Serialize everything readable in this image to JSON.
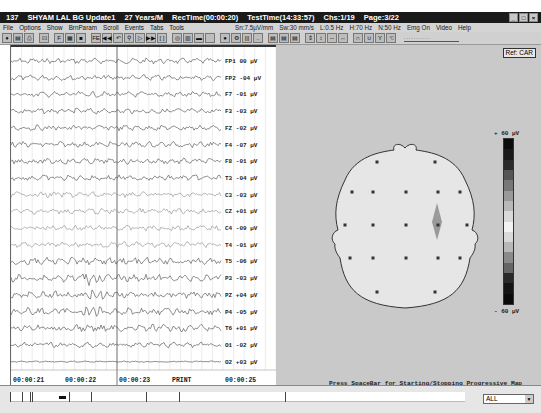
{
  "titlebar": {
    "record_id": "137",
    "patient": "SHYAM LAL BG Update1",
    "age_sex": "27 Years/M",
    "rec_time": "RecTime(00:00:20)",
    "test_time": "TestTime(14:33:57)",
    "channel": "Chs:1/19",
    "page": "Page:3/22",
    "minimize": "_",
    "maximize": "□",
    "close": "×"
  },
  "menu": {
    "items": [
      "File",
      "Options",
      "Show",
      "BrnParam",
      "Scroll",
      "Events",
      "Tabs",
      "Tools"
    ],
    "status": [
      "Sn:7.5µV/mm",
      "Sw:30 mm/s",
      "L:0.5 Hz",
      "H:70 Hz",
      "N:50 Hz",
      "Emg On"
    ],
    "right_items": [
      "Video",
      "Help"
    ]
  },
  "toolbar": {
    "buttons": [
      {
        "name": "montage-icon",
        "glyph": "♦"
      },
      {
        "name": "open-icon",
        "glyph": "▤"
      },
      {
        "name": "print-icon",
        "glyph": "⎙"
      },
      {
        "name": "fit-icon",
        "glyph": "⊡"
      },
      {
        "name": "filter-icon",
        "glyph": "F"
      },
      {
        "name": "page-icon",
        "glyph": "▦"
      },
      {
        "name": "block-icon",
        "glyph": "■"
      },
      {
        "name": "fe-icon",
        "glyph": "FE"
      },
      {
        "name": "rewind-icon",
        "glyph": "◀◀"
      },
      {
        "name": "back-icon",
        "glyph": "↶"
      },
      {
        "name": "search-icon",
        "glyph": "⚲"
      },
      {
        "name": "mark-icon",
        "glyph": "▷"
      },
      {
        "name": "forward-icon",
        "glyph": "▶▶"
      },
      {
        "name": "bracket-icon",
        "glyph": "[ ]"
      },
      {
        "name": "photo-icon",
        "glyph": "◎"
      },
      {
        "name": "grid-icon",
        "glyph": "▥"
      },
      {
        "name": "bar-icon",
        "glyph": "▬"
      },
      {
        "name": "blank-icon",
        "glyph": ""
      },
      {
        "name": "record-icon",
        "glyph": "●"
      },
      {
        "name": "settings-icon",
        "glyph": "⚙"
      },
      {
        "name": "columns-icon",
        "glyph": "|||"
      },
      {
        "name": "dots-icon",
        "glyph": ".."
      },
      {
        "name": "map1-icon",
        "glyph": "▤"
      },
      {
        "name": "map2-icon",
        "glyph": "▤"
      },
      {
        "name": "map3-icon",
        "glyph": "▤"
      },
      {
        "name": "collapse-icon",
        "glyph": "⇕"
      },
      {
        "name": "expand-icon",
        "glyph": "↕"
      },
      {
        "name": "narrow-icon",
        "glyph": "⇔"
      },
      {
        "name": "widen-icon",
        "glyph": "↔"
      },
      {
        "name": "wave-icon",
        "glyph": "∩"
      },
      {
        "name": "wave2-icon",
        "glyph": "∪"
      },
      {
        "name": "marker-icon",
        "glyph": "Y"
      },
      {
        "name": "cursor-icon",
        "glyph": "☜"
      }
    ],
    "slider_label": "..........."
  },
  "eeg": {
    "timestamps": [
      {
        "label": "00:00:21",
        "x": 0
      },
      {
        "label": "00:00:22",
        "x": 52
      },
      {
        "label": "00:00:23",
        "x": 106
      },
      {
        "label": "PRINT",
        "x": 159
      },
      {
        "label": "00:00:25",
        "x": 212
      }
    ],
    "channels": [
      {
        "name": "FP1",
        "value": "00 µV"
      },
      {
        "name": "FP2",
        "value": "-04 µV"
      },
      {
        "name": "F7",
        "value": "-01 µV"
      },
      {
        "name": "F3",
        "value": "-03 µV"
      },
      {
        "name": "FZ",
        "value": "-02 µV"
      },
      {
        "name": "F4",
        "value": "-07 µV"
      },
      {
        "name": "F8",
        "value": "-01 µV"
      },
      {
        "name": "T3",
        "value": "-04 µV"
      },
      {
        "name": "C3",
        "value": "-03 µV"
      },
      {
        "name": "CZ",
        "value": "+01 µV"
      },
      {
        "name": "C4",
        "value": "-09 µV"
      },
      {
        "name": "T4",
        "value": "-01 µV"
      },
      {
        "name": "T5",
        "value": "-06 µV"
      },
      {
        "name": "P3",
        "value": "-03 µV"
      },
      {
        "name": "PZ",
        "value": "+04 µV"
      },
      {
        "name": "P4",
        "value": "-05 µV"
      },
      {
        "name": "T6",
        "value": "+01 µV"
      },
      {
        "name": "O1",
        "value": "-02 µV"
      },
      {
        "name": "O2",
        "value": "+03 µV"
      }
    ]
  },
  "map": {
    "reference": "Ref: CAR",
    "scale_max": "+ 60 µV",
    "scale_min": "- 60 µV",
    "colorbar": [
      "#0c0c0c",
      "#1a1a1a",
      "#2a2a2a",
      "#555555",
      "#777777",
      "#999999",
      "#b8b8b8",
      "#d9d9d9",
      "#f2f2f2",
      "#d9d9d9",
      "#b8b8b8",
      "#8a8a8a",
      "#666666",
      "#2a2a2a",
      "#141414",
      "#0a0a0a"
    ],
    "hint": "Press SpaceBar for Starting/Stopping Progressive Map"
  },
  "statusbar": {
    "select_value": "ALL",
    "select_arrow": "▼"
  }
}
